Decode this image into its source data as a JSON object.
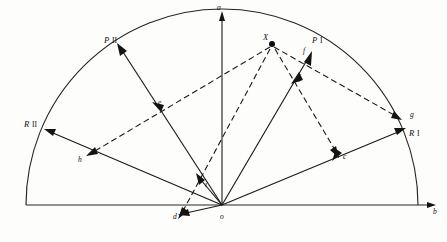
{
  "figure": {
    "type": "vector-phasor-half-circle-diagram",
    "background_color": "#fdfdfc",
    "ink_color": "#141414",
    "width": 447,
    "height": 242,
    "axes": {
      "origin_label": "o",
      "vertical_tip_label": "a",
      "horizontal_tip_label": "b"
    },
    "vector_labels": {
      "p_two": "P",
      "p_two_roman": "II",
      "p_one": "P",
      "p_one_roman": "I",
      "r_two": "R",
      "r_two_roman": "II",
      "r_one": "R",
      "r_one_roman": "I"
    },
    "point_labels": {
      "x": "X",
      "c": "c",
      "d": "d",
      "e": "e",
      "f": "f",
      "g": "g",
      "h": "h",
      "i": "i",
      "j": "j"
    },
    "geometry": {
      "origin": [
        222,
        205
      ],
      "radius": 196,
      "arc_start": [
        26,
        205
      ],
      "arc_end": [
        418,
        205
      ],
      "baseline_left": [
        26,
        205
      ],
      "baseline_right": [
        437,
        205
      ],
      "vertical_tip": [
        222,
        12
      ],
      "x_point": [
        272,
        44
      ],
      "ray_endpoints": {
        "p_two": [
          118,
          47
        ],
        "p_one": [
          311,
          54
        ],
        "r_two": [
          46,
          129
        ],
        "r_one": [
          404,
          128
        ],
        "d": [
          179,
          211
        ],
        "g": [
          399,
          118
        ],
        "h": [
          85,
          155
        ]
      },
      "interior_points": {
        "c": [
          338,
          155
        ],
        "e": [
          157,
          109
        ],
        "f": [
          303,
          59
        ],
        "i": [
          203,
          174
        ],
        "j": [
          296,
          76
        ]
      }
    }
  }
}
